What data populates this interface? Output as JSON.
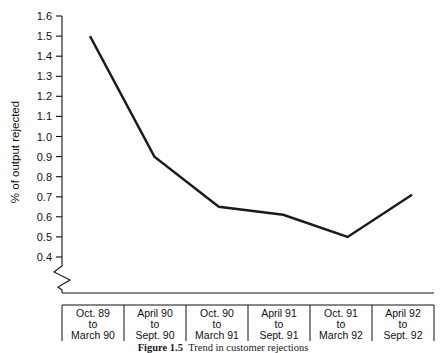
{
  "chart_data": {
    "type": "line",
    "title": "",
    "xlabel": "",
    "ylabel": "% of output rejected",
    "categories": [
      "Oct. 89 to March 90",
      "April 90 to Sept. 90",
      "Oct. 90 to March 91",
      "April 91 to Sept. 91",
      "Oct. 91 to March 92",
      "April 92 to Sept. 92"
    ],
    "values": [
      1.5,
      0.9,
      0.65,
      0.61,
      0.5,
      0.71
    ],
    "ylim": [
      0.4,
      1.6
    ],
    "ytick_labels": [
      "1.6",
      "1.5",
      "1.4",
      "1.3",
      "1.2",
      "1.1",
      "1.0",
      "0.9",
      "0.8",
      "0.7",
      "0.6",
      "0.5",
      "0.4"
    ],
    "ytick_values": [
      1.6,
      1.5,
      1.4,
      1.3,
      1.2,
      1.1,
      1.0,
      0.9,
      0.8,
      0.7,
      0.6,
      0.5,
      0.4
    ],
    "grid": false,
    "legend": "none",
    "axis_break": true,
    "line_color": "#1a1a1a",
    "axis_color": "#111111"
  },
  "category_labels": [
    {
      "line1": "Oct. 89",
      "line2": "to",
      "line3": "March 90"
    },
    {
      "line1": "April 90",
      "line2": "to",
      "line3": "Sept. 90"
    },
    {
      "line1": "Oct. 90",
      "line2": "to",
      "line3": "March 91"
    },
    {
      "line1": "April 91",
      "line2": "to",
      "line3": "Sept. 91"
    },
    {
      "line1": "Oct. 91",
      "line2": "to",
      "line3": "March 92"
    },
    {
      "line1": "April 92",
      "line2": "to",
      "line3": "Sept. 92"
    }
  ],
  "caption": {
    "number": "Figure 1.5",
    "text": "Trend in customer rejections"
  }
}
